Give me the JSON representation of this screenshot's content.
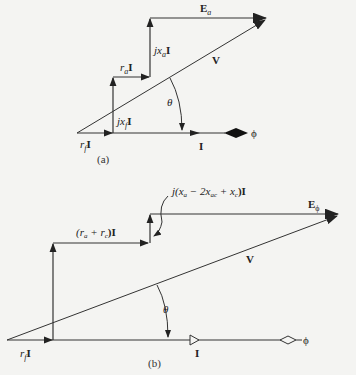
{
  "diagram_a": {
    "caption": "(a)",
    "labels": {
      "Ea": "E",
      "Ea_sub": "a",
      "V": "V",
      "jxaI": "jx",
      "jxaI_sub": "a",
      "raI": "r",
      "raI_sub": "a",
      "jxfI": "jx",
      "jxfI_sub": "f",
      "rfI": "r",
      "rfI_sub": "f",
      "theta": "θ",
      "I": "I",
      "phi": "ϕ"
    }
  },
  "diagram_b": {
    "caption": "(b)",
    "labels": {
      "jx_expr": "j(x",
      "jx_expr_a": "a",
      "jx_expr_mid": " − 2x",
      "jx_expr_ac": "ac",
      "jx_expr_plus": " + x",
      "jx_expr_c": "c",
      "jx_expr_end": ")I",
      "ra_rc": "(r",
      "ra_rc_a": "a",
      "ra_rc_plus": " + r",
      "ra_rc_c": "c",
      "ra_rc_end": ")I",
      "Ephi": "E",
      "Ephi_sub": "ϕ",
      "V": "V",
      "theta": "θ",
      "rfI": "r",
      "rfI_sub": "f",
      "I": "I",
      "phi": "ϕ"
    }
  }
}
